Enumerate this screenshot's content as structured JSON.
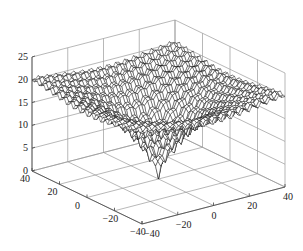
{
  "chart_data": {
    "type": "surface3d",
    "title": "",
    "function": "Ackley-like surface: plateau near 20 with oscillations, sharp minimum 0 at origin",
    "x": {
      "label": "",
      "range": [
        -40,
        40
      ],
      "ticks": [
        40,
        20,
        0,
        -20,
        -40
      ]
    },
    "y": {
      "label": "",
      "range": [
        -40,
        40
      ],
      "ticks": [
        -40,
        -20,
        0,
        20,
        40
      ]
    },
    "z": {
      "label": "",
      "range": [
        0,
        25
      ],
      "ticks": [
        0,
        5,
        10,
        15,
        20,
        25
      ]
    },
    "grid": true,
    "colors": {
      "mesh_edge": "#111111",
      "mesh_face": "#ffffff",
      "grid": "#9a9a9a",
      "axis": "#444444"
    },
    "min_point": {
      "x": 0,
      "y": 0,
      "z": 0
    },
    "plateau_z": 21
  }
}
